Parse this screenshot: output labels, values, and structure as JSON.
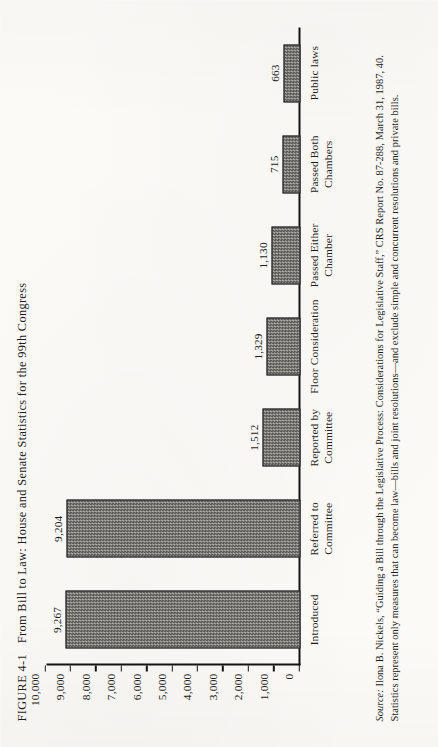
{
  "figure": {
    "number": "FIGURE 4-1",
    "title": "From Bill to Law: House and Senate Statistics for the 99th Congress"
  },
  "source": {
    "lead": "Source:",
    "text": " Ilona B. Nickels, “Guiding a Bill through the Legislative Process: Considerations for Legislative Staff,” CRS Report No. 87-288, March 31, 1987, 40. Statistics represent only measures that can become law—bills and joint resolutions—and exclude simple and concurrent resolutions and private bills."
  },
  "chart_data": {
    "type": "bar",
    "title": "From Bill to Law: House and Senate Statistics for the 99th Congress",
    "xlabel": "",
    "ylabel": "",
    "ylim": [
      0,
      10000
    ],
    "grid": false,
    "legend": "none",
    "orientation": "vertical",
    "categories": [
      "Introduced",
      "Referred to Committee",
      "Reported by Committee",
      "Floor Consideration",
      "Passed Either Chamber",
      "Passed Both Chambers",
      "Public laws"
    ],
    "values": [
      9267,
      9204,
      1512,
      1329,
      1130,
      715,
      663
    ],
    "value_labels": [
      "9,267",
      "9,204",
      "1,512",
      "1,329",
      "1,130",
      "715",
      "663"
    ],
    "ytick_values": [
      10000,
      9000,
      8000,
      7000,
      6000,
      5000,
      4000,
      3000,
      2000,
      1000,
      0
    ],
    "ytick_labels": [
      "10,000",
      "9,000",
      "8,000",
      "7,000",
      "6,000",
      "5,000",
      "4,000",
      "3,000",
      "2,000",
      "1,000",
      "0"
    ]
  },
  "colors": {
    "page_background": "#fbfaf7",
    "ink": "#1d1c1a",
    "bar_fill_dark": "#3a3936",
    "bar_fill_light": "#cfcec9",
    "axis": "#141312"
  }
}
